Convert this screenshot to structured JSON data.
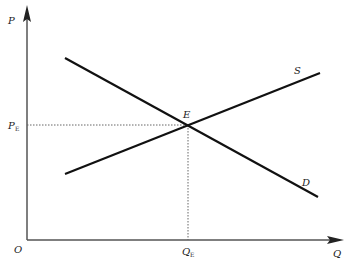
{
  "diagram": {
    "title": "",
    "type": "supply-demand equilibrium",
    "axes": {
      "y_label": "P",
      "x_label": "Q",
      "origin_label": "O"
    },
    "curves": [
      {
        "name": "S",
        "label": "S",
        "from": [
          65,
          174
        ],
        "to": [
          320,
          73
        ]
      },
      {
        "name": "D",
        "label": "D",
        "from": [
          65,
          58
        ],
        "to": [
          318,
          197
        ]
      }
    ],
    "equilibrium": {
      "label": "E",
      "price_label": "P",
      "price_sub": "E",
      "quantity_label": "Q",
      "quantity_sub": "E"
    },
    "colors": {
      "axis": "#555555",
      "curve": "#111111",
      "guide": "#666666"
    }
  }
}
